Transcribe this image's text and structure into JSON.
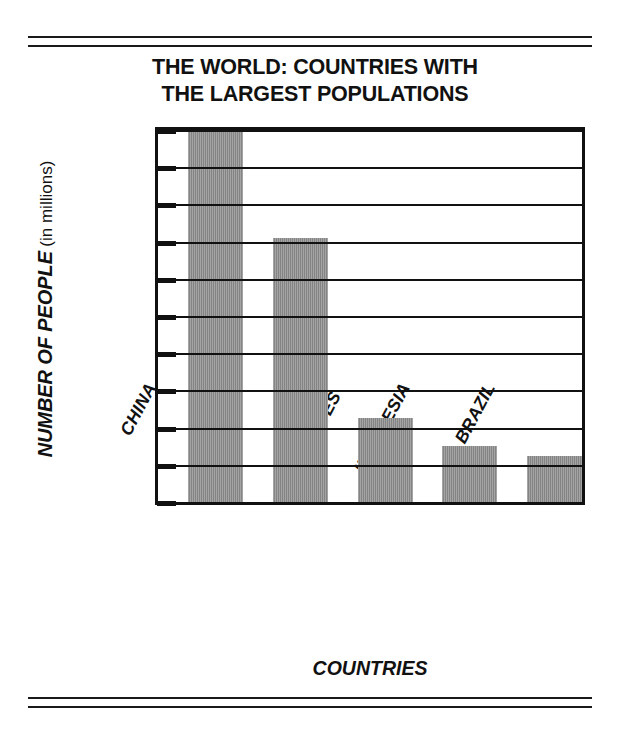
{
  "chart_data": {
    "type": "bar",
    "title": "THE WORLD: COUNTRIES WITH THE LARGEST POPULATIONS",
    "title_lines": [
      "THE WORLD: COUNTRIES WITH",
      "THE LARGEST POPULATIONS"
    ],
    "xlabel": "COUNTRIES",
    "ylabel": "NUMBER OF PEOPLE",
    "ylabel_unit": "(in millions)",
    "categories": [
      "CHINA",
      "INDIA",
      "UNITED STATES",
      "INDONESIA",
      "BRAZIL"
    ],
    "category_label_lines": [
      [
        "CHINA"
      ],
      [
        "INDIA"
      ],
      [
        "UNITED",
        "STATES"
      ],
      [
        "INDONESIA"
      ],
      [
        "BRAZIL"
      ]
    ],
    "values": [
      1000,
      710,
      225,
      150,
      125
    ],
    "ylim": [
      0,
      1000
    ],
    "ytick_values": [
      1000,
      900,
      800,
      700,
      600,
      500,
      400,
      300,
      200,
      100,
      0
    ],
    "ytick_labels": [
      "1,000",
      "900",
      "800",
      "700",
      "600",
      "500",
      "400",
      "300",
      "200",
      "100",
      "0"
    ],
    "grid": true,
    "grid_axis": "y",
    "legend": null,
    "bar_color": "#8b8b8b",
    "frame_color": "#111111"
  },
  "figure": {
    "top_rules": 2,
    "bottom_rules": 2,
    "background": "#ffffff"
  }
}
